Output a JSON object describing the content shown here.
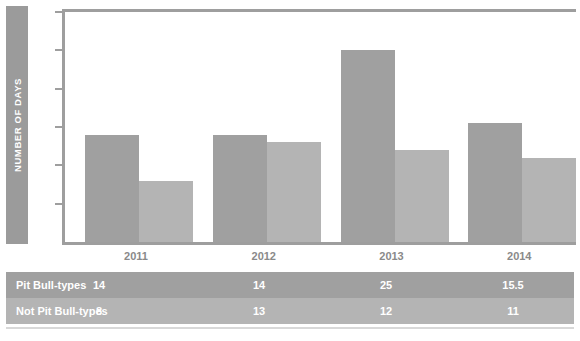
{
  "chart_data": {
    "type": "bar",
    "title": "",
    "xlabel": "",
    "ylabel": "NUMBER OF DAYS",
    "categories": [
      "2011",
      "2012",
      "2013",
      "2014"
    ],
    "series": [
      {
        "name": "Pit Bull-types",
        "values": [
          14,
          14,
          25,
          15.5
        ],
        "color": "#a0a0a0"
      },
      {
        "name": "Not Pit Bull-types",
        "values": [
          8,
          13,
          12,
          11
        ],
        "color": "#b4b4b4"
      }
    ],
    "ylim": [
      0,
      30
    ],
    "yticks": [
      30,
      25,
      20,
      15,
      10,
      5
    ],
    "ytick_labels": [
      "30",
      "25",
      "20",
      "15",
      "10",
      "5"
    ],
    "grid": false,
    "legend": "none",
    "table": {
      "column_headers": [
        "2011",
        "2012",
        "2013",
        "2014"
      ],
      "rows": [
        {
          "label": "Pit Bull-types",
          "values": [
            "14",
            "14",
            "25",
            "15.5"
          ]
        },
        {
          "label": "Not Pit Bull-types",
          "values": [
            "8",
            "13",
            "12",
            "11"
          ]
        }
      ]
    }
  },
  "colors": {
    "series_0": "#a0a0a0",
    "series_1": "#b4b4b4",
    "axis": "#9e9e9e",
    "tick_text": "#8a8a8a",
    "ylabel_bar": "#9b9b9b",
    "table_text": "#ffffff",
    "background": "#ffffff"
  }
}
